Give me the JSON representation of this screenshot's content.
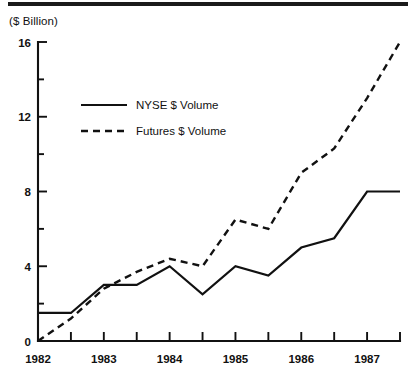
{
  "figure": {
    "unit_label": "($ Billion)",
    "has_top_rule": true
  },
  "chart_data": {
    "type": "line",
    "title": "",
    "subtitle": "",
    "xlabel": "",
    "ylabel": "($ Billion)",
    "xlim": [
      1982.0,
      1987.5
    ],
    "ylim": [
      0,
      16
    ],
    "grid": false,
    "legend_position": "upper-left-inside",
    "x": [
      1982.0,
      1982.5,
      1983.0,
      1983.5,
      1984.0,
      1984.5,
      1985.0,
      1985.5,
      1986.0,
      1986.5,
      1987.0,
      1987.5
    ],
    "x_tick_values": [
      1982.0,
      1982.5,
      1983.0,
      1983.5,
      1984.0,
      1984.5,
      1985.0,
      1985.5,
      1986.0,
      1986.5,
      1987.0,
      1987.5
    ],
    "x_major_labels": [
      "1982",
      "1983",
      "1984",
      "1985",
      "1986",
      "1987"
    ],
    "x_major_values": [
      1982,
      1983,
      1984,
      1985,
      1986,
      1987
    ],
    "y_major_labels": [
      "0",
      "4",
      "8",
      "12",
      "16"
    ],
    "y_major_values": [
      0,
      4,
      8,
      12,
      16
    ],
    "y_minor_values": [
      2,
      6,
      10,
      14
    ],
    "series": [
      {
        "name": "NYSE $ Volume",
        "style": "solid",
        "color": "#111111",
        "values": [
          1.5,
          1.5,
          3.0,
          3.0,
          4.0,
          2.5,
          4.0,
          3.5,
          5.0,
          5.5,
          8.0,
          8.0
        ]
      },
      {
        "name": "Futures $ Volume",
        "style": "dashed",
        "color": "#111111",
        "values": [
          0.0,
          1.2,
          2.8,
          3.7,
          4.4,
          4.0,
          6.5,
          6.0,
          9.0,
          10.3,
          13.0,
          16.0
        ]
      }
    ]
  },
  "legend": {
    "entries": [
      {
        "label": "NYSE $ Volume",
        "style": "solid"
      },
      {
        "label": "Futures $ Volume",
        "style": "dashed"
      }
    ]
  }
}
